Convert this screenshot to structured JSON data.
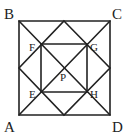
{
  "diagram": {
    "type": "geometry",
    "labels": {
      "A": "A",
      "B": "B",
      "C": "C",
      "D": "D",
      "E": "E",
      "F": "F",
      "G": "G",
      "H": "H",
      "P": "P"
    },
    "colors": {
      "stroke": "#222222",
      "background": "#ffffff"
    }
  }
}
